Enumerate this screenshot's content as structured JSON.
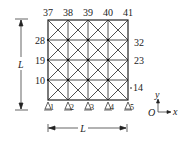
{
  "diagram": {
    "top_labels": [
      "37",
      "38",
      "39",
      "40",
      "41"
    ],
    "left_labels": [
      "28",
      "19",
      "10"
    ],
    "right_labels": [
      "32",
      "23",
      "14"
    ],
    "support_labels": [
      "1",
      "2",
      "3",
      "4",
      "5"
    ],
    "dimension_vertical": "L",
    "dimension_horizontal": "L",
    "axes": {
      "origin": "O",
      "x": "x",
      "y": "y"
    },
    "grid": {
      "cells_x": 4,
      "cells_y": 4,
      "diagonals": "both"
    }
  }
}
